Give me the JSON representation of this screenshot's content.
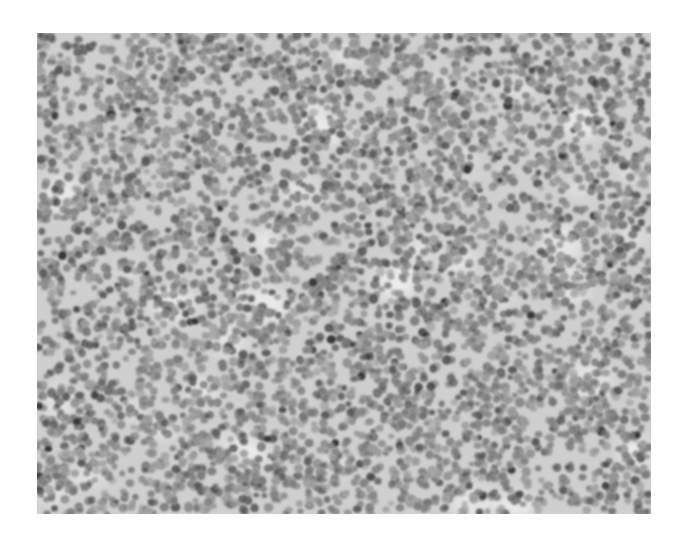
{
  "image": {
    "kind": "grayscale histology micrograph",
    "description": "Densely packed small round cells (nuclei) on light stroma, uniform field, no labels or scale bar",
    "frame": {
      "x": 37,
      "y": 33,
      "width": 614,
      "height": 481
    },
    "colors": {
      "page_background": "#ffffff",
      "stroma_light": "#ececec",
      "stroma_mid": "#c9c9c9",
      "nucleus_light": "#9a9a9a",
      "nucleus_mid": "#7a7a7a",
      "nucleus_dark": "#555555",
      "nucleus_darkest": "#2e2e2e"
    },
    "texture": {
      "seed": 1337,
      "cell_count": 5200,
      "cell_radius_min": 3.2,
      "cell_radius_max": 5.2,
      "dark_cell_fraction": 0.025,
      "light_patch_count": 40
    }
  }
}
